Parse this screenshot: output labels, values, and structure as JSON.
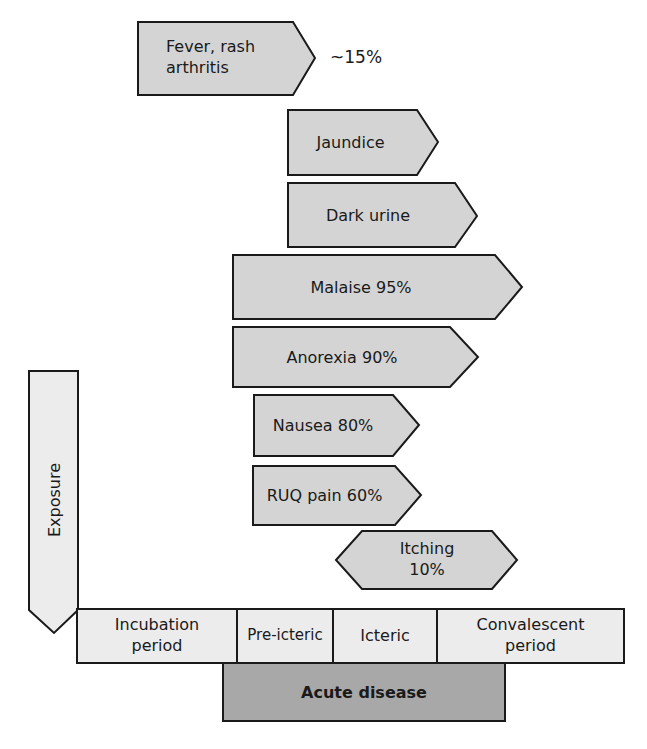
{
  "diagram": {
    "symptoms": [
      {
        "label_line1": "Fever, rash",
        "label_line2": "arthritis",
        "annotation": "~15%"
      },
      {
        "label": "Jaundice"
      },
      {
        "label": "Dark urine"
      },
      {
        "label": "Malaise 95%"
      },
      {
        "label": "Anorexia 90%"
      },
      {
        "label": "Nausea 80%"
      },
      {
        "label": "RUQ pain 60%"
      },
      {
        "label_line1": "Itching",
        "label_line2": "10%"
      }
    ],
    "exposure": {
      "label": "Exposure"
    },
    "timeline": {
      "phases": [
        {
          "line1": "Incubation",
          "line2": "period"
        },
        {
          "line1": "Pre-icteric"
        },
        {
          "line1": "Icteric"
        },
        {
          "line1": "Convalescent",
          "line2": "period"
        }
      ]
    },
    "acute": {
      "label": "Acute disease"
    },
    "colors": {
      "symptom_fill": "#d4d4d4",
      "timeline_fill": "#ececec",
      "acute_fill": "#a8a8a8",
      "stroke": "#1a1a1a"
    }
  }
}
